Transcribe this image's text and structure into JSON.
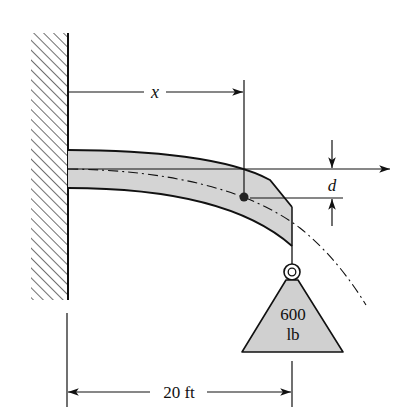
{
  "figure": {
    "type": "cantilever-beam-deflection",
    "labels": {
      "x_dimension": "x",
      "deflection": "d",
      "span": "20 ft",
      "load_value": "600",
      "load_unit": "lb"
    },
    "colors": {
      "beam_fill": "#d4d4d4",
      "weight_fill": "#d0d0d0",
      "line": "#111111",
      "background": "#ffffff"
    }
  }
}
